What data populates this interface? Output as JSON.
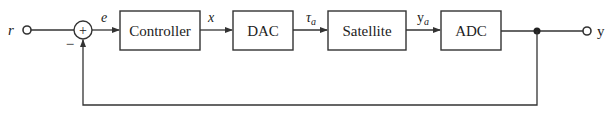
{
  "diagram": {
    "type": "feedback-control-block-diagram",
    "input": {
      "label": "r"
    },
    "output": {
      "label": "y"
    },
    "summing_junction": {
      "symbol": "+",
      "feedback_sign": "−"
    },
    "signals": {
      "error": "e",
      "controller_out": "x",
      "dac_out_main": "τ",
      "dac_out_sub": "a",
      "satellite_out_main": "y",
      "satellite_out_sub": "a"
    },
    "blocks": [
      {
        "id": "controller",
        "label": "Controller"
      },
      {
        "id": "dac",
        "label": "DAC"
      },
      {
        "id": "satellite",
        "label": "Satellite"
      },
      {
        "id": "adc",
        "label": "ADC"
      }
    ],
    "colors": {
      "stroke": "#333333",
      "text": "#222222",
      "background": "#ffffff"
    }
  }
}
